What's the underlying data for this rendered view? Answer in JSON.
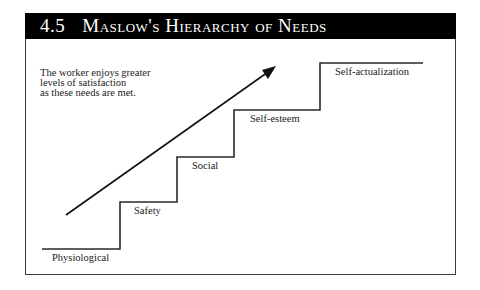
{
  "header": {
    "number": "4.5",
    "title": "Maslow's Hierarchy of Needs"
  },
  "note": {
    "lines": [
      "The worker enjoys greater",
      "levels of satisfaction",
      "as these needs are met."
    ]
  },
  "steps": [
    {
      "label": "Physiological"
    },
    {
      "label": "Safety"
    },
    {
      "label": "Social"
    },
    {
      "label": "Self-esteem"
    },
    {
      "label": "Self-actualization"
    }
  ],
  "colors": {
    "header_bg": "#000000",
    "header_text": "#ffffff",
    "line": "#2a2a2a",
    "text": "#222222"
  }
}
